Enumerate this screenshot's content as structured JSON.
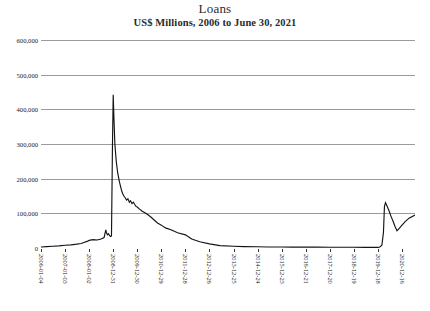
{
  "chart_data": {
    "type": "line",
    "title": "Loans",
    "subtitle": "US$ Millions, 2006 to June 30, 2021",
    "xlabel": "",
    "ylabel": "",
    "ylim": [
      0,
      600000
    ],
    "grid": true,
    "legend": "none",
    "ytick_labels": [
      "600,000",
      "500,000",
      "400,000",
      "300,000",
      "200,000",
      "100,000",
      "0"
    ],
    "ytick_values": [
      600000,
      500000,
      400000,
      300000,
      200000,
      100000,
      0
    ],
    "xtick_labels": [
      "2006-01-04",
      "2007-01-03",
      "2008-01-02",
      "2008-12-31",
      "2009-12-30",
      "2010-12-29",
      "2011-12-28",
      "2012-12-26",
      "2013-12-25",
      "2014-12-24",
      "2015-12-23",
      "2016-12-21",
      "2017-12-20",
      "2018-12-19",
      "2019-12-18",
      "2020-12-16"
    ],
    "series": [
      {
        "name": "Loans",
        "color": "#141414",
        "x": [
          "2006-01-04",
          "2006-04-01",
          "2006-07-01",
          "2006-10-01",
          "2007-01-03",
          "2007-04-01",
          "2007-07-01",
          "2007-09-01",
          "2007-10-15",
          "2007-12-01",
          "2008-01-02",
          "2008-03-01",
          "2008-05-01",
          "2008-07-01",
          "2008-08-15",
          "2008-09-10",
          "2008-09-20",
          "2008-10-05",
          "2008-10-20",
          "2008-11-05",
          "2008-11-20",
          "2008-12-05",
          "2008-12-20",
          "2008-12-31",
          "2009-01-10",
          "2009-01-25",
          "2009-02-15",
          "2009-03-10",
          "2009-04-05",
          "2009-05-01",
          "2009-05-20",
          "2009-06-10",
          "2009-07-01",
          "2009-07-20",
          "2009-08-10",
          "2009-09-01",
          "2009-09-20",
          "2009-10-10",
          "2009-11-01",
          "2009-11-20",
          "2009-12-10",
          "2009-12-30",
          "2010-02-01",
          "2010-03-15",
          "2010-05-01",
          "2010-06-15",
          "2010-08-01",
          "2010-09-15",
          "2010-11-01",
          "2010-12-29",
          "2011-03-01",
          "2011-06-01",
          "2011-09-01",
          "2011-12-28",
          "2012-04-01",
          "2012-08-01",
          "2012-12-26",
          "2013-06-01",
          "2013-12-25",
          "2014-06-01",
          "2014-12-24",
          "2015-06-01",
          "2015-12-23",
          "2016-06-01",
          "2016-12-21",
          "2017-06-01",
          "2017-12-20",
          "2018-06-01",
          "2018-12-19",
          "2019-06-01",
          "2019-12-18",
          "2020-01-15",
          "2020-02-15",
          "2020-03-10",
          "2020-03-25",
          "2020-04-10",
          "2020-05-01",
          "2020-06-01",
          "2020-07-01",
          "2020-08-01",
          "2020-09-01",
          "2020-10-01",
          "2020-11-01",
          "2020-12-16",
          "2021-02-01",
          "2021-04-01",
          "2021-06-30"
        ],
        "values": [
          3000,
          4000,
          5000,
          6000,
          8000,
          9000,
          11000,
          13000,
          16000,
          19000,
          22000,
          24000,
          23000,
          26000,
          30000,
          52000,
          44000,
          38000,
          41000,
          36000,
          33000,
          35000,
          300000,
          442000,
          380000,
          300000,
          250000,
          215000,
          190000,
          170000,
          158000,
          150000,
          145000,
          138000,
          142000,
          132000,
          136000,
          128000,
          132000,
          126000,
          120000,
          118000,
          112000,
          106000,
          101000,
          95000,
          88000,
          80000,
          72000,
          66000,
          58000,
          52000,
          44000,
          38000,
          26000,
          18000,
          12000,
          7000,
          5000,
          4000,
          3500,
          3000,
          2800,
          2600,
          2500,
          2400,
          2300,
          2200,
          2100,
          2000,
          2000,
          3000,
          8000,
          45000,
          120000,
          131000,
          122000,
          108000,
          92000,
          78000,
          62000,
          50000,
          56000,
          66000,
          76000,
          86000,
          95000
        ]
      }
    ],
    "annotations": {
      "peak_label": "442,000",
      "peak_date": "2008-12-31",
      "secondary_peak_label": "131,000",
      "secondary_peak_date": "2020-04-10"
    }
  }
}
